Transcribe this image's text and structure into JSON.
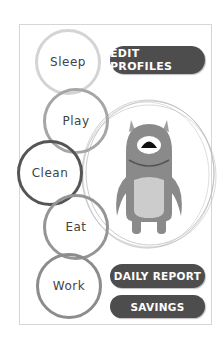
{
  "activities": [
    {
      "label": "Sleep",
      "ring_color": "#d4d4d4"
    },
    {
      "label": "Play",
      "ring_color": "#a6a6a6"
    },
    {
      "label": "Clean",
      "ring_color": "#555555"
    },
    {
      "label": "Eat",
      "ring_color": "#959595"
    },
    {
      "label": "Work",
      "ring_color": "#8c8c8c"
    }
  ],
  "buttons": {
    "edit_profiles": "EDIT PROFILES",
    "daily_report": "DAILY REPORT",
    "savings": "SAVINGS"
  },
  "character": {
    "name": "monster-avatar",
    "body_color": "#8a8a8a",
    "belly_color": "#cccccc"
  },
  "colors": {
    "button_bg": "#4d4d4d",
    "button_text": "#ffffff",
    "frame_border": "#d6d6d6"
  }
}
